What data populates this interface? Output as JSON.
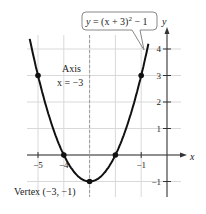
{
  "chart_data": {
    "type": "line",
    "title": "",
    "equation_label": "y = (x + 3)² − 1",
    "equation_parts": {
      "lhs": "y = (x + 3)",
      "exp": "2",
      "rhs": " − 1"
    },
    "xlabel": "x",
    "ylabel": "y",
    "xlim": [
      -5.5,
      0.5
    ],
    "ylim": [
      -1.5,
      4.5
    ],
    "xticks": [
      -5,
      -4,
      -1
    ],
    "xtick_labels": [
      "−5",
      "−4",
      "−1"
    ],
    "yticks": [
      -1,
      1,
      2,
      3,
      4
    ],
    "ytick_labels": [
      "−1",
      "1",
      "2",
      "3",
      "4"
    ],
    "grid": true,
    "series": [
      {
        "name": "y = (x + 3)^2 - 1",
        "function": "(x+3)^2-1",
        "x": [
          -5.2,
          -5,
          -4.5,
          -4,
          -3.5,
          -3,
          -2.5,
          -2,
          -1.5,
          -1,
          -0.8
        ],
        "values": [
          3.84,
          3,
          1.25,
          0,
          -0.75,
          -1,
          -0.75,
          0,
          1.25,
          3,
          3.84
        ]
      }
    ],
    "marked_points": [
      {
        "x": -5,
        "y": 3
      },
      {
        "x": -4,
        "y": 0
      },
      {
        "x": -3,
        "y": -1
      },
      {
        "x": -2,
        "y": 0
      },
      {
        "x": -1,
        "y": 3
      }
    ],
    "annotations": {
      "axis_line1": "Axis",
      "axis_line2": "x = −3",
      "vertex": "Vertex (−3, −1)"
    },
    "axis_of_symmetry": -3
  },
  "colors": {
    "curve": "#111111",
    "grid": "#d9d9d9",
    "axis": "#333333",
    "dash": "#9a9a9a",
    "box_border": "#888888"
  }
}
